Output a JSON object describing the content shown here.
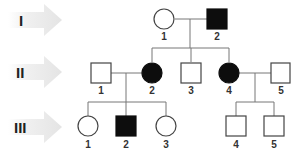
{
  "diagram": {
    "type": "pedigree",
    "legend": {
      "affected_fill": "#0d0d0d",
      "unaffected_fill": "#ffffff",
      "line_color": "#777777",
      "arrow_color": "#e6e6e6"
    },
    "generations": [
      {
        "label": "I",
        "individuals": [
          {
            "id": "1",
            "sex": "female",
            "affected": false
          },
          {
            "id": "2",
            "sex": "male",
            "affected": true
          }
        ]
      },
      {
        "label": "II",
        "individuals": [
          {
            "id": "1",
            "sex": "male",
            "affected": false
          },
          {
            "id": "2",
            "sex": "female",
            "affected": true
          },
          {
            "id": "3",
            "sex": "male",
            "affected": false
          },
          {
            "id": "4",
            "sex": "female",
            "affected": true
          },
          {
            "id": "5",
            "sex": "male",
            "affected": false
          }
        ]
      },
      {
        "label": "III",
        "individuals": [
          {
            "id": "1",
            "sex": "female",
            "affected": false
          },
          {
            "id": "2",
            "sex": "male",
            "affected": true
          },
          {
            "id": "3",
            "sex": "female",
            "affected": false
          },
          {
            "id": "4",
            "sex": "male",
            "affected": false
          },
          {
            "id": "5",
            "sex": "male",
            "affected": false
          }
        ]
      }
    ],
    "matings": [
      {
        "parents": [
          "I-1",
          "I-2"
        ],
        "children": [
          "II-2",
          "II-3",
          "II-4"
        ]
      },
      {
        "parents": [
          "II-1",
          "II-2"
        ],
        "children": [
          "III-1",
          "III-2",
          "III-3"
        ]
      },
      {
        "parents": [
          "II-4",
          "II-5"
        ],
        "children": [
          "III-4",
          "III-5"
        ]
      }
    ]
  }
}
